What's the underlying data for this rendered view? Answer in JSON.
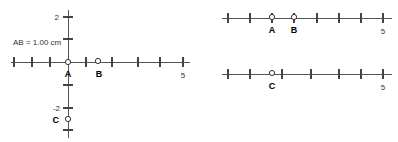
{
  "panels": {
    "left": {
      "name": "coordinate-plane",
      "measurement_label": "AB = 1.00 cm",
      "x_axis": {
        "tick_count": 9,
        "labeled_ticks": [
          {
            "label": "5",
            "index": 8
          }
        ],
        "origin_index": 3
      },
      "y_axis": {
        "labeled_ticks": [
          {
            "label": "2",
            "value": 2
          },
          {
            "label": "-2",
            "value": -2
          }
        ]
      },
      "points": [
        {
          "name": "A",
          "label": "A",
          "x": 0,
          "y": 0
        },
        {
          "name": "B",
          "label": "B",
          "x": 1,
          "y": 0
        },
        {
          "name": "C",
          "label": "C",
          "x": 0,
          "y": -2.3
        }
      ]
    },
    "top_right": {
      "name": "number-line-ab",
      "tick_count": 9,
      "end_label": "5",
      "points": [
        {
          "name": "A",
          "label": "A",
          "tick_index": 2
        },
        {
          "name": "B",
          "label": "B",
          "tick_index": 3
        }
      ]
    },
    "bottom_right": {
      "name": "number-line-c",
      "tick_count": 9,
      "end_label": "5",
      "points": [
        {
          "name": "C",
          "label": "C",
          "tick_index": 2
        }
      ]
    }
  },
  "colors": {
    "background": "#ffffff",
    "axis": "#555555",
    "tick": "#444444",
    "text": "#333333",
    "marker_stroke": "#333333",
    "marker_fill": "#ffffff"
  }
}
